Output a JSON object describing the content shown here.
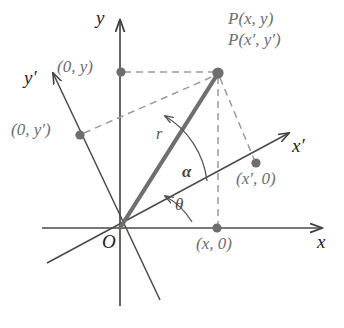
{
  "figure": {
    "colors": {
      "background": "#ffffff",
      "axis": "#4a4a4a",
      "dashed": "#8d8d8d",
      "radius": "#6f6f6f",
      "dot": "#6e6e6e",
      "text_dark": "#222222",
      "text_gray": "#6e6e6e"
    },
    "axes": [
      {
        "name": "x",
        "label": "x",
        "label_x": 317,
        "label_y": 237
      },
      {
        "name": "y",
        "label": "y",
        "label_x": 96,
        "label_y": 10
      },
      {
        "name": "x-prime",
        "label": "x′",
        "label_x": 294,
        "label_y": 142
      },
      {
        "name": "y-prime",
        "label": "y′",
        "label_x": 25,
        "label_y": 72
      }
    ],
    "origin": {
      "label": "O",
      "label_x": 103,
      "label_y": 236
    },
    "points": [
      {
        "name": "point-p",
        "label_1": "P(x, y)",
        "label_2": "P(x′, y′)",
        "label_x": 228,
        "label_y": 12,
        "label2_y": 33,
        "cx": 218,
        "cy": 73
      },
      {
        "name": "point-x-axis-projection",
        "label": "(x, 0)",
        "label_x": 196,
        "label_y": 237,
        "cx": 217,
        "cy": 228
      },
      {
        "name": "point-y-axis-projection",
        "label": "(0, y)",
        "label_x": 57,
        "label_y": 60,
        "cx": 121,
        "cy": 72
      },
      {
        "name": "point-x-prime-projection",
        "label": "(x′, 0)",
        "label_x": 236,
        "label_y": 172,
        "cx": 256,
        "cy": 163
      },
      {
        "name": "point-y-prime-projection",
        "label": "(0, y′)",
        "label_x": 12,
        "label_y": 123,
        "cx": 80,
        "cy": 135
      }
    ],
    "segments": [
      {
        "name": "radius",
        "label": "r",
        "label_x": 157,
        "label_y": 129
      }
    ],
    "angles": [
      {
        "name": "alpha",
        "label": "α",
        "label_x": 183,
        "label_y": 170,
        "description": "angle between x-prime axis and radius r"
      },
      {
        "name": "theta",
        "label": "θ",
        "label_x": 176,
        "label_y": 203,
        "description": "angle between x axis and x-prime axis"
      }
    ]
  }
}
